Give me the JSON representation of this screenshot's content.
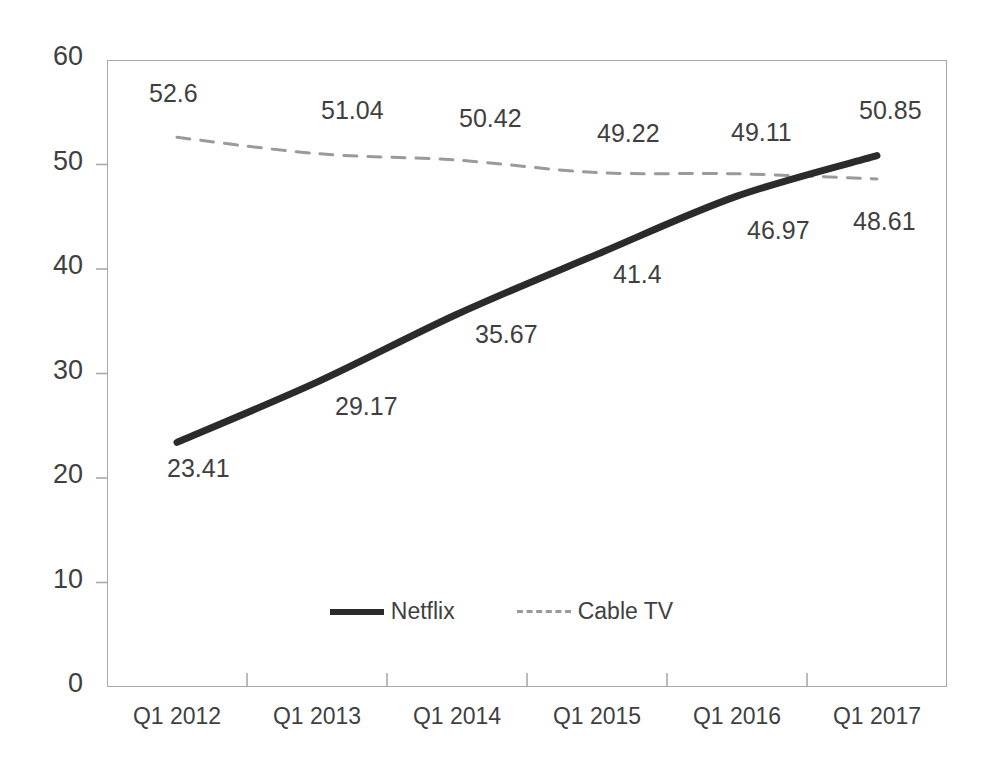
{
  "chart_data": {
    "type": "line",
    "title": "",
    "subtitle": "",
    "xlabel": "",
    "ylabel": "",
    "categories": [
      "Q1 2012",
      "Q1 2013",
      "Q1 2014",
      "Q1 2015",
      "Q1 2016",
      "Q1 2017"
    ],
    "series": [
      {
        "name": "Netflix",
        "values": [
          23.41,
          29.17,
          35.67,
          41.4,
          46.97,
          50.85
        ],
        "labels": [
          "23.41",
          "29.17",
          "35.67",
          "41.4",
          "46.97",
          "50.85"
        ],
        "style": "solid",
        "color": "#2b2b2b",
        "width": 7
      },
      {
        "name": "Cable TV",
        "values": [
          52.6,
          51.04,
          50.42,
          49.22,
          49.11,
          48.61
        ],
        "labels": [
          "52.6",
          "51.04",
          "50.42",
          "49.22",
          "49.11",
          "48.61"
        ],
        "style": "dashed",
        "color": "#9a9a9a",
        "width": 3
      }
    ],
    "ylim": [
      0,
      60
    ],
    "yticks": [
      0,
      10,
      20,
      30,
      40,
      50,
      60
    ],
    "ytick_labels": [
      "0",
      "10",
      "20",
      "30",
      "40",
      "50",
      "60"
    ],
    "grid": false,
    "legend_position": "bottom-center",
    "legend": [
      "Netflix",
      "Cable TV"
    ],
    "axis_color": "#a9a9a9",
    "text_color": "#3f3f3f"
  },
  "annotations": {
    "netflix_label_offsets": [
      {
        "dx": -10,
        "dy": 28
      },
      {
        "dx": 18,
        "dy": 26
      },
      {
        "dx": 18,
        "dy": 22
      },
      {
        "dx": 16,
        "dy": 22
      },
      {
        "dx": 10,
        "dy": 36
      },
      {
        "dx": -18,
        "dy": -44
      }
    ],
    "cable_label_offsets": [
      {
        "dx": -28,
        "dy": -42
      },
      {
        "dx": 4,
        "dy": -42
      },
      {
        "dx": 2,
        "dy": -40
      },
      {
        "dx": 0,
        "dy": -38
      },
      {
        "dx": -6,
        "dy": -40
      },
      {
        "dx": -24,
        "dy": 44
      }
    ]
  }
}
